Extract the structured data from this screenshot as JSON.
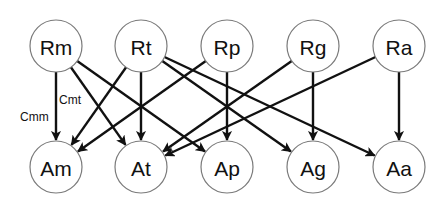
{
  "diagram": {
    "node_radius": 26,
    "nodes": [
      {
        "id": "Rm",
        "label": "Rm",
        "x": 56,
        "y": 46,
        "row": "top"
      },
      {
        "id": "Rt",
        "label": "Rt",
        "x": 141,
        "y": 46,
        "row": "top"
      },
      {
        "id": "Rp",
        "label": "Rp",
        "x": 227,
        "y": 46,
        "row": "top"
      },
      {
        "id": "Rg",
        "label": "Rg",
        "x": 313,
        "y": 46,
        "row": "top"
      },
      {
        "id": "Ra",
        "label": "Ra",
        "x": 399,
        "y": 46,
        "row": "top"
      },
      {
        "id": "Am",
        "label": "Am",
        "x": 56,
        "y": 167,
        "row": "bottom"
      },
      {
        "id": "At",
        "label": "At",
        "x": 141,
        "y": 167,
        "row": "bottom"
      },
      {
        "id": "Ap",
        "label": "Ap",
        "x": 227,
        "y": 167,
        "row": "bottom"
      },
      {
        "id": "Ag",
        "label": "Ag",
        "x": 313,
        "y": 167,
        "row": "bottom"
      },
      {
        "id": "Aa",
        "label": "Aa",
        "x": 399,
        "y": 167,
        "row": "bottom"
      }
    ],
    "edges": [
      {
        "from": "Rm",
        "to": "Am",
        "label": "Cmm"
      },
      {
        "from": "Rm",
        "to": "At",
        "label": "Cmt"
      },
      {
        "from": "Rm",
        "to": "Ap"
      },
      {
        "from": "Rt",
        "to": "Am"
      },
      {
        "from": "Rt",
        "to": "At"
      },
      {
        "from": "Rt",
        "to": "Ag"
      },
      {
        "from": "Rt",
        "to": "Aa"
      },
      {
        "from": "Rp",
        "to": "Am"
      },
      {
        "from": "Rp",
        "to": "Ap"
      },
      {
        "from": "Rg",
        "to": "At"
      },
      {
        "from": "Rg",
        "to": "Ag"
      },
      {
        "from": "Ra",
        "to": "At"
      },
      {
        "from": "Ra",
        "to": "Aa"
      }
    ],
    "edge_labels": [
      {
        "text": "Cmm",
        "x": 20,
        "y": 121
      },
      {
        "text": "Cmt",
        "x": 59,
        "y": 104
      }
    ],
    "colors": {
      "edge": "#111111",
      "node_stroke": "#7a7a7a",
      "node_fill": "#ffffff",
      "text": "#111111"
    }
  }
}
